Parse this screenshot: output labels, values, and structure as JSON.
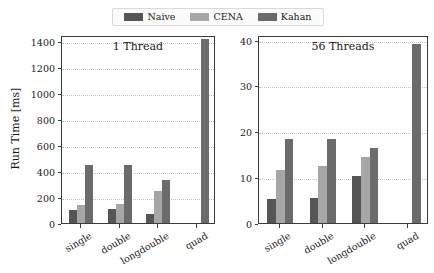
{
  "legend": {
    "position": "top-center",
    "entries": [
      {
        "label": "Naive",
        "color": "#555555",
        "swatch_name": "legend-swatch-naive"
      },
      {
        "label": "CENA",
        "color": "#a6a6a6",
        "swatch_name": "legend-swatch-cena"
      },
      {
        "label": "Kahan",
        "color": "#6b6b6b",
        "swatch_name": "legend-swatch-kahan"
      }
    ]
  },
  "axis": {
    "ylabel": "Run Time [ms]"
  },
  "chart_data": [
    {
      "type": "bar",
      "title": "1 Thread",
      "panel": "left",
      "categories": [
        "single",
        "double",
        "longdouble",
        "quad"
      ],
      "series": [
        {
          "name": "Naive",
          "color": "#555555",
          "values": [
            100,
            105,
            70,
            0
          ]
        },
        {
          "name": "CENA",
          "color": "#a6a6a6",
          "values": [
            140,
            150,
            250,
            0
          ]
        },
        {
          "name": "Kahan",
          "color": "#6b6b6b",
          "values": [
            450,
            450,
            330,
            1420
          ]
        }
      ],
      "xlabel": "",
      "ylabel": "Run Time [ms]",
      "ylim": [
        0,
        1450
      ],
      "yticks": [
        0,
        200,
        400,
        600,
        800,
        1000,
        1200,
        1400
      ],
      "ytick_labels": [
        "0",
        "200",
        "400",
        "600",
        "800",
        "1000",
        "1200",
        "1400"
      ],
      "grid": true,
      "legend_position": "figure-top-center"
    },
    {
      "type": "bar",
      "title": "56 Threads",
      "panel": "right",
      "categories": [
        "single",
        "double",
        "longdouble",
        "quad"
      ],
      "series": [
        {
          "name": "Naive",
          "color": "#555555",
          "values": [
            5.3,
            5.4,
            10.3,
            0
          ]
        },
        {
          "name": "CENA",
          "color": "#a6a6a6",
          "values": [
            11.5,
            12.5,
            14.3,
            0
          ]
        },
        {
          "name": "Kahan",
          "color": "#6b6b6b",
          "values": [
            18.3,
            18.3,
            16.3,
            39.0
          ]
        }
      ],
      "xlabel": "",
      "ylabel": "",
      "ylim": [
        0,
        41
      ],
      "yticks": [
        0,
        10,
        20,
        30,
        40
      ],
      "ytick_labels": [
        "0",
        "10",
        "20",
        "30",
        "40"
      ],
      "grid": true,
      "legend_position": "figure-top-center"
    }
  ]
}
